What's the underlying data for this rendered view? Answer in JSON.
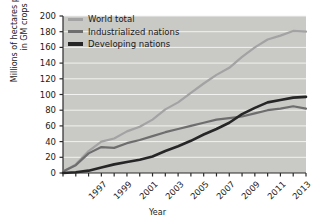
{
  "chart_data": {
    "type": "line",
    "title": "",
    "xlabel": "Year",
    "ylabel": "Millions of hectares planted in GM crops",
    "ylabel_line1": "Millions of hectares planted",
    "ylabel_line2": "in GM crops",
    "xlim": [
      1996,
      2015
    ],
    "ylim": [
      0,
      200
    ],
    "ytick_step": 20,
    "yticks": [
      0,
      20,
      40,
      60,
      80,
      100,
      120,
      140,
      160,
      180,
      200
    ],
    "ytick_labels": [
      "0",
      "20",
      "40",
      "60",
      "80",
      "100",
      "120",
      "140",
      "160",
      "180",
      "200"
    ],
    "x": [
      1996,
      1997,
      1998,
      1999,
      2000,
      2001,
      2002,
      2003,
      2004,
      2005,
      2006,
      2007,
      2008,
      2009,
      2010,
      2011,
      2012,
      2013,
      2014,
      2015
    ],
    "xticks": [
      1996,
      1997,
      1998,
      1999,
      2000,
      2001,
      2002,
      2003,
      2004,
      2005,
      2006,
      2007,
      2008,
      2009,
      2010,
      2011,
      2012,
      2013,
      2014,
      2015
    ],
    "xtick_labels": [
      "",
      "1997",
      "",
      "1999",
      "",
      "2001",
      "",
      "2003",
      "",
      "2005",
      "",
      "2007",
      "",
      "2009",
      "",
      "2011",
      "",
      "2013",
      "",
      "2015"
    ],
    "grid": "horizontal-white",
    "legend_position": "top-left-inside",
    "plot_background": "#c9c9c6",
    "series": [
      {
        "name": "World total",
        "color": "#a3a3a3",
        "values": [
          2,
          11,
          28,
          40,
          44,
          53,
          59,
          68,
          81,
          90,
          102,
          114,
          125,
          134,
          148,
          160,
          170,
          175,
          181,
          180
        ]
      },
      {
        "name": "Industrialized nations",
        "color": "#6e6e6e",
        "values": [
          2,
          10,
          25,
          33,
          32,
          38,
          42,
          47,
          52,
          56,
          60,
          64,
          68,
          70,
          72,
          76,
          80,
          82,
          85,
          82
        ]
      },
      {
        "name": "Developing nations",
        "color": "#262626",
        "values": [
          0,
          1,
          3,
          7,
          11,
          14,
          17,
          21,
          28,
          34,
          41,
          49,
          56,
          64,
          75,
          83,
          90,
          93,
          96,
          97
        ]
      }
    ]
  },
  "legend": {
    "items": [
      {
        "label": "World total",
        "color": "#a3a3a3"
      },
      {
        "label": "Industrialized nations",
        "color": "#6e6e6e"
      },
      {
        "label": "Developing nations",
        "color": "#262626"
      }
    ]
  }
}
